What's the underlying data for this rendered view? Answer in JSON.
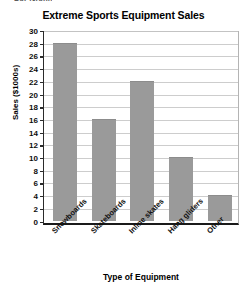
{
  "page": {
    "clipped_header_text": "Bar Graph"
  },
  "chart_data": {
    "type": "bar",
    "title": "Extreme Sports Equipment Sales",
    "xlabel": "Type of Equipment",
    "ylabel": "Sales ($1000s)",
    "categories": [
      "Snowboards",
      "Skateboards",
      "Inline skates",
      "Hang gliders",
      "Other"
    ],
    "values": [
      28,
      16,
      22,
      10,
      4
    ],
    "ylim": [
      0,
      30
    ],
    "ytick_step": 2,
    "yticks": [
      30,
      28,
      26,
      24,
      22,
      20,
      18,
      16,
      14,
      12,
      10,
      8,
      6,
      4,
      2,
      0
    ],
    "grid": true,
    "legend": null,
    "bar_color": "#9a9a9a",
    "gridline_color": "#cdcdcd",
    "axis_color": "#1a1a1a"
  }
}
